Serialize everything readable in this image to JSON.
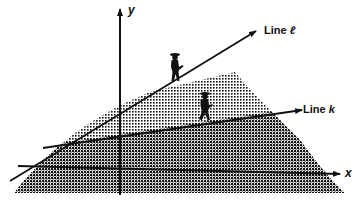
{
  "diagram": {
    "axes": {
      "x_label": "x",
      "y_label": "y"
    },
    "lines": [
      {
        "id": "l",
        "prefix": "Line ",
        "var": "ℓ"
      },
      {
        "id": "k",
        "prefix": "Line ",
        "var": "k"
      }
    ],
    "figures": [
      {
        "name": "hiker-on-line-l"
      },
      {
        "name": "hiker-on-line-k"
      }
    ],
    "colors": {
      "ink": "#111111",
      "background": "#ffffff"
    }
  }
}
